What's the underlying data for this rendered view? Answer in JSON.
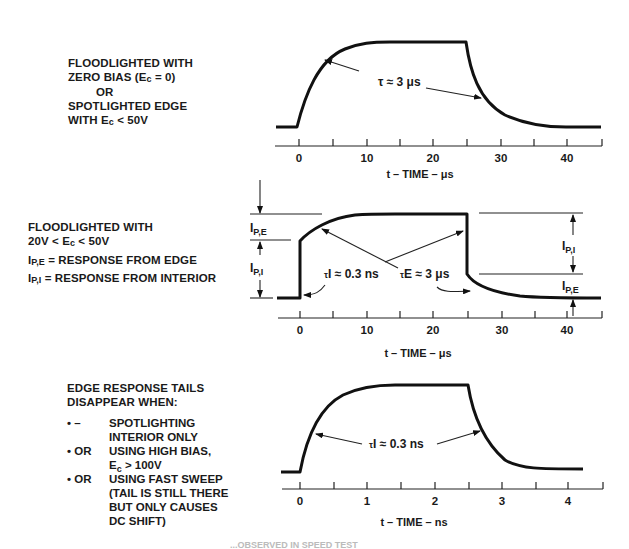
{
  "panel1": {
    "label_lines": [
      "FLOODLIGHTED WITH",
      "ZERO BIAS (E",
      "c",
      " = 0)",
      "OR",
      "SPOTLIGHTED EDGE",
      "WITH E",
      "c",
      " < 50V"
    ],
    "annotation": "τ ≈ 3 μs",
    "axis_title": "t – TIME – μs",
    "tick_labels": [
      "0",
      "10",
      "20",
      "30",
      "40"
    ]
  },
  "panel2": {
    "label_line1": "FLOODLIGHTED WITH",
    "label_line2a": "20V < E",
    "label_line2_sub": "c",
    "label_line2b": " < 50V",
    "def_edge_sym": "I",
    "def_edge_sub": "P,E",
    "def_edge_text": " = RESPONSE FROM EDGE",
    "def_int_sym": "I",
    "def_int_sub": "P,I",
    "def_int_text": " = RESPONSE FROM INTERIOR",
    "left_upper_label": "I",
    "left_upper_sub": "P,E",
    "left_lower_label": "I",
    "left_lower_sub": "P,I",
    "right_upper_label": "I",
    "right_upper_sub": "P,I",
    "right_lower_label": "I",
    "right_lower_sub": "P,E",
    "annotation_interior_tau": "τ",
    "annotation_interior_sub": "I",
    "annotation_interior_val": " ≈ 0.3 ns",
    "annotation_edge_tau": "τ",
    "annotation_edge_sub": "E",
    "annotation_edge_val": " ≈ 3 μs",
    "axis_title": "t – TIME – μs",
    "tick_labels": [
      "0",
      "10",
      "20",
      "30",
      "40"
    ]
  },
  "panel3": {
    "heading_line1": "EDGE RESPONSE TAILS",
    "heading_line2": "DISAPPEAR WHEN:",
    "conditions": [
      {
        "bullet": "• –",
        "lines": [
          "SPOTLIGHTING",
          "INTERIOR ONLY"
        ]
      },
      {
        "bullet": "• OR",
        "lines": [
          "USING HIGH BIAS,",
          "E_c > 100V"
        ]
      },
      {
        "bullet": "• OR",
        "lines": [
          "USING FAST SWEEP",
          "(TAIL IS STILL THERE",
          "BUT ONLY CAUSES",
          "DC SHIFT)"
        ]
      }
    ],
    "cond2_line2_a": "E",
    "cond2_line2_sub": "c",
    "cond2_line2_b": " > 100V",
    "annotation_tau": "τ",
    "annotation_sub": "I",
    "annotation_val": " ≈ 0.3 ns",
    "axis_title": "t – TIME – ns",
    "tick_labels": [
      "0",
      "1",
      "2",
      "3",
      "4"
    ]
  },
  "caption_partial": "...OBSERVED IN SPEED TEST"
}
